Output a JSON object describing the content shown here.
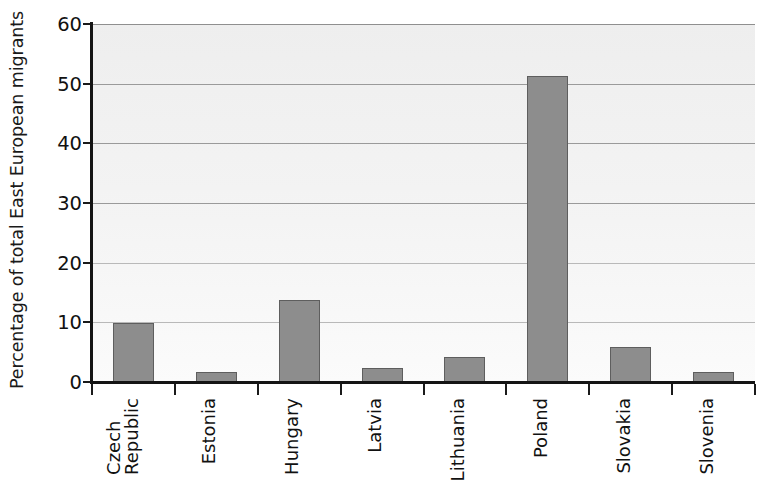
{
  "chart_data": {
    "type": "bar",
    "title": "",
    "subtitle": "",
    "xlabel": "",
    "ylabel": "Percentage of total East European migrants",
    "categories": [
      "Czech Republic",
      "Estonia",
      "Hungary",
      "Latvia",
      "Lithuania",
      "Poland",
      "Slovakia",
      "Slovenia"
    ],
    "category_lines": [
      [
        "Czech",
        "Republic"
      ],
      [
        "Estonia"
      ],
      [
        "Hungary"
      ],
      [
        "Latvia"
      ],
      [
        "Lithuania"
      ],
      [
        "Poland"
      ],
      [
        "Slovakia"
      ],
      [
        "Slovenia"
      ]
    ],
    "values": [
      9.9,
      1.7,
      13.7,
      2.4,
      4.2,
      51.3,
      5.9,
      1.7
    ],
    "ylim": [
      0,
      60
    ],
    "yticks": [
      0,
      10,
      20,
      30,
      40,
      50,
      60
    ],
    "ytick_labels": [
      "0",
      "10",
      "20",
      "30",
      "40",
      "50",
      "60"
    ],
    "grid": true,
    "grid_axis": "y",
    "legend": false,
    "legend_position": "none",
    "xtick_rotation": -90,
    "bar_color": "#8d8d8d",
    "bar_edge_color": "#5e5e5e",
    "plot_background": "#efefef",
    "gridline_color": "#9a9a9a",
    "axis_color": "#141414",
    "text_color": "#111111"
  }
}
